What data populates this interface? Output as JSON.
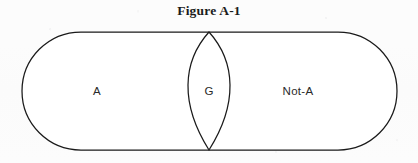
{
  "figure": {
    "title": "Figure A-1",
    "type": "venn-diagram",
    "shape": "capsule-with-central-lens",
    "stroke_color": "#1a1a1a",
    "fill_color": "#ffffff",
    "background_color": "#fcfcfc",
    "regions": [
      {
        "id": "left",
        "label": "A",
        "name": "region-a"
      },
      {
        "id": "center",
        "label": "G",
        "name": "region-g"
      },
      {
        "id": "right",
        "label": "Not-A",
        "name": "region-not-a"
      }
    ],
    "labels": {
      "left": "A",
      "center": "G",
      "right": "Not-A"
    }
  }
}
